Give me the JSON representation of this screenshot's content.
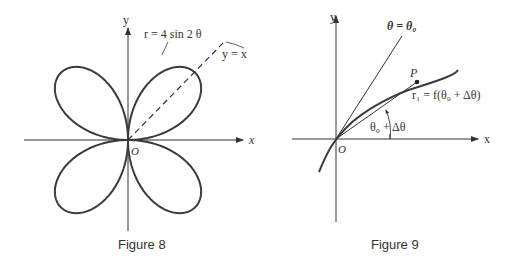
{
  "figure8": {
    "caption": "Figure 8",
    "equation_label": "r = 4 sin 2 θ",
    "line_label": "y = x",
    "axis_x": "x",
    "axis_y": "y",
    "origin": "O",
    "curve": "four-leaved rose r = 4 sin 2θ",
    "line_color": "#3a3a3a"
  },
  "figure9": {
    "caption": "Figure 9",
    "ray_label": "θ = θ₀",
    "point_label": "P",
    "radius_label": "r₁ = f(θ₀ + Δθ)",
    "angle_label": "θ₀ + Δθ",
    "axis_x": "x",
    "axis_y": "y",
    "origin": "O",
    "line_color": "#3a3a3a"
  }
}
